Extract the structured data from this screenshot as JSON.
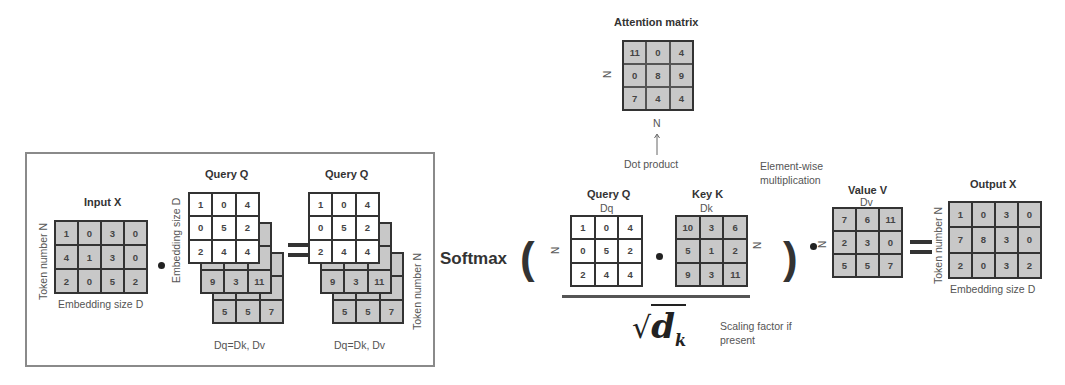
{
  "left_panel": {
    "input_x": {
      "title": "Input X",
      "row_label": "Token number N",
      "col_label": "Embedding size D",
      "cells": [
        [
          1,
          0,
          3,
          0
        ],
        [
          4,
          1,
          3,
          0
        ],
        [
          2,
          0,
          5,
          2
        ]
      ]
    },
    "weight_stack": {
      "title": "Query Q",
      "side_label": "Embedding size D",
      "bottom_label": "Dq=Dk, Dv",
      "front_cells": [
        [
          1,
          0,
          4
        ],
        [
          0,
          5,
          2
        ],
        [
          2,
          4,
          4
        ]
      ],
      "back_layer_1_visible_row": [
        9,
        3,
        11
      ],
      "back_layer_2_visible_row": [
        5,
        5,
        7
      ]
    },
    "result_stack": {
      "title": "Query Q",
      "side_label": "Token number N",
      "bottom_label": "Dq=Dk, Dv",
      "front_cells": [
        [
          1,
          0,
          4
        ],
        [
          0,
          5,
          2
        ],
        [
          2,
          4,
          4
        ]
      ],
      "back_layer_1_visible_row": [
        9,
        3,
        11
      ],
      "back_layer_2_visible_row": [
        5,
        5,
        7
      ]
    }
  },
  "attention": {
    "title": "Attention matrix",
    "row_label": "N",
    "col_label": "N",
    "cells": [
      [
        11,
        0,
        4
      ],
      [
        0,
        8,
        9
      ],
      [
        7,
        4,
        4
      ]
    ],
    "arrow_label": "Dot product"
  },
  "formula": {
    "softmax_label": "Softmax",
    "query": {
      "title": "Query Q",
      "subtitle": "Dq",
      "row_label": "N",
      "cells": [
        [
          1,
          0,
          4
        ],
        [
          0,
          5,
          2
        ],
        [
          2,
          4,
          4
        ]
      ]
    },
    "key": {
      "title": "Key K",
      "subtitle": "Dk",
      "row_label": "N",
      "cells": [
        [
          10,
          3,
          6
        ],
        [
          5,
          1,
          2
        ],
        [
          9,
          3,
          11
        ]
      ]
    },
    "denominator": "√d",
    "denominator_subscript": "k",
    "scaling_note_line1": "Scaling factor if",
    "scaling_note_line2": "present",
    "elementwise_line1": "Element-wise",
    "elementwise_line2": "multiplication",
    "value": {
      "title": "Value V",
      "subtitle": "Dv",
      "row_label": "N",
      "cells": [
        [
          7,
          6,
          11
        ],
        [
          2,
          3,
          0
        ],
        [
          5,
          5,
          7
        ]
      ]
    },
    "output": {
      "title": "Output X",
      "row_label": "Token number N",
      "col_label": "Embedding size D",
      "cells": [
        [
          1,
          0,
          3,
          0
        ],
        [
          7,
          8,
          3,
          0
        ],
        [
          2,
          0,
          3,
          2
        ]
      ]
    }
  }
}
